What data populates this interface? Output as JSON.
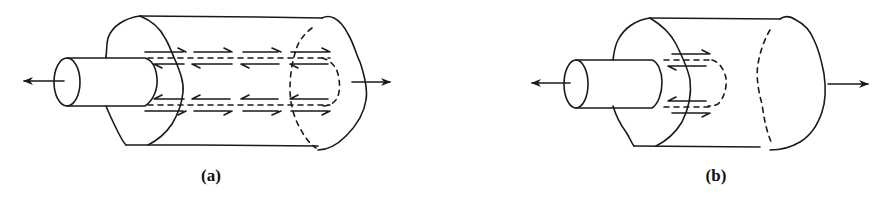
{
  "figure": {
    "panels": [
      {
        "id": "a",
        "label": "(a)",
        "description": "Rod embedded in matrix cylinder; shear stress arrows distributed along full embedded length",
        "shear_arrow_segments": 4,
        "external_force_arrows": [
          "left-pull-on-rod",
          "right-pull-on-matrix"
        ]
      },
      {
        "id": "b",
        "label": "(b)",
        "description": "Rod embedded in matrix cylinder; shear stress arrows concentrated near the entry point",
        "shear_arrow_segments": 1,
        "external_force_arrows": [
          "left-pull-on-rod",
          "right-pull-on-matrix"
        ]
      }
    ],
    "stroke_color": "#1a1a1a",
    "background_color": "#ffffff"
  }
}
